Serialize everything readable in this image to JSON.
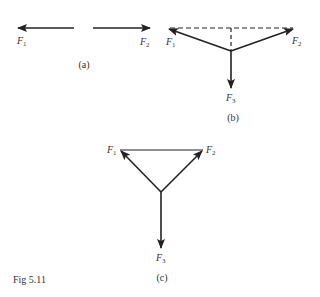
{
  "figure": {
    "caption": "Fig 5.11",
    "panels": [
      {
        "id": "a",
        "label": "(a)",
        "forces": [
          {
            "name": "F",
            "sub": "1",
            "direction": "left"
          },
          {
            "name": "F",
            "sub": "2",
            "direction": "right"
          }
        ]
      },
      {
        "id": "b",
        "label": "(b)",
        "forces": [
          {
            "name": "F",
            "sub": "1",
            "direction": "up-left"
          },
          {
            "name": "F",
            "sub": "2",
            "direction": "up-right"
          },
          {
            "name": "F",
            "sub": "3",
            "direction": "down"
          }
        ],
        "construction": "dashed resultant lines"
      },
      {
        "id": "c",
        "label": "(c)",
        "forces": [
          {
            "name": "F",
            "sub": "1",
            "direction": "up-left"
          },
          {
            "name": "F",
            "sub": "2",
            "direction": "up-right"
          },
          {
            "name": "F",
            "sub": "3",
            "direction": "down"
          }
        ],
        "construction": "solid line joining F1 and F2"
      }
    ],
    "colors": {
      "ink": "#222222",
      "text": "#333333"
    }
  }
}
